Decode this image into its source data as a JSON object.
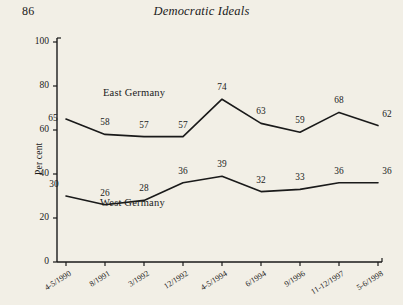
{
  "page": {
    "folio": "86",
    "running_head": "Democratic Ideals",
    "background_color": "#f2efe6",
    "ink_color": "#1a1a1a"
  },
  "chart_data": {
    "type": "line",
    "title": "",
    "xlabel": "",
    "ylabel": "Per cent",
    "ylim": [
      0,
      100
    ],
    "yticks": [
      0,
      20,
      40,
      60,
      80,
      100
    ],
    "grid": false,
    "legend": "inline-annotation",
    "categories": [
      "4-5/1990",
      "8/1991",
      "3/1992",
      "12/1992",
      "4-5/1994",
      "6/1994",
      "9/1996",
      "11-12/1997",
      "5-6/1998"
    ],
    "series": [
      {
        "name": "East Germany",
        "values": [
          65,
          58,
          57,
          57,
          74,
          63,
          59,
          68,
          62
        ],
        "color": "#1a1a1a"
      },
      {
        "name": "West Germany",
        "values": [
          30,
          26,
          28,
          36,
          39,
          32,
          33,
          36,
          36
        ],
        "color": "#1a1a1a"
      }
    ]
  }
}
